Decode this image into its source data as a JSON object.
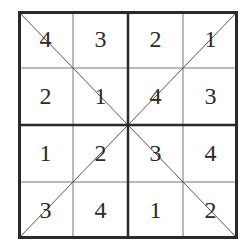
{
  "puzzle": {
    "type": "4x4 diagonal sudoku",
    "rows": [
      [
        "4",
        "3",
        "2",
        "1"
      ],
      [
        "2",
        "1",
        "4",
        "3"
      ],
      [
        "1",
        "2",
        "3",
        "4"
      ],
      [
        "3",
        "4",
        "1",
        "2"
      ]
    ],
    "colors": {
      "line": "#2a2a2a",
      "thin_line": "#777777",
      "background": "#ffffff"
    }
  }
}
